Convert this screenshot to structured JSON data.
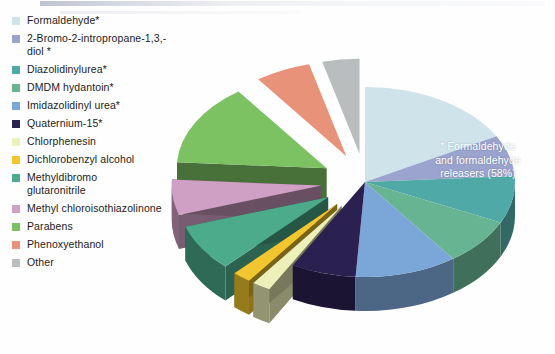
{
  "figure": {
    "background": "#ffffff"
  },
  "legend": {
    "items": [
      {
        "label": "Formaldehyde*",
        "color": "#cfe3ea"
      },
      {
        "label": "2-Bromo-2-intropropane-1,3,-\ndiol *",
        "color": "#9aa4ce"
      },
      {
        "label": "Diazolidinylurea*",
        "color": "#4fa9a6"
      },
      {
        "label": "DMDM hydantoin*",
        "color": "#67b493"
      },
      {
        "label": "Imidazolidinyl urea*",
        "color": "#7aa6d8"
      },
      {
        "label": "Quaternium-15*",
        "color": "#2b2150"
      },
      {
        "label": "Chlorphenesin",
        "color": "#edf0b8"
      },
      {
        "label": "Dichlorobenzyl alcohol",
        "color": "#f2c62e"
      },
      {
        "label": "Methyldibromo\nglutaronitrile",
        "color": "#4cab8a"
      },
      {
        "label": "Methyl chloroisothiazolinone",
        "color": "#cfa0c4"
      },
      {
        "label": "Parabens",
        "color": "#7cc162"
      },
      {
        "label": "Phenoxyethanol",
        "color": "#e8927a"
      },
      {
        "label": "Other",
        "color": "#b9bdbe"
      }
    ]
  },
  "callout": {
    "line1": "* Formaldehyde",
    "line2": "and formaldehyde",
    "line3": "releasers (58%)",
    "text_color": "#ffffff"
  },
  "chart_data": {
    "type": "pie",
    "annotations": [
      "* Formaldehyde and formaldehyde releasers (58%)"
    ],
    "legend_position": "left",
    "three_d": true,
    "grouped_total_label": "* Formaldehyde and formaldehyde releasers (58%)",
    "grouped_total_value": 58,
    "categories": [
      "Formaldehyde*",
      "2-Bromo-2-intropropane-1,3,-diol *",
      "Diazolidinylurea*",
      "DMDM hydantoin*",
      "Imidazolidinyl urea*",
      "Quaternium-15*",
      "Chlorphenesin",
      "Dichlorobenzyl alcohol",
      "Methyldibromo glutaronitrile",
      "Methyl chloroisothiazolinone",
      "Parabens",
      "Phenoxyethanol",
      "Other"
    ],
    "values": [
      17,
      7,
      8,
      8,
      11,
      7,
      2,
      2,
      8,
      6,
      14,
      6,
      4
    ],
    "colors": [
      "#cfe3ea",
      "#9aa4ce",
      "#4fa9a6",
      "#67b493",
      "#7aa6d8",
      "#2b2150",
      "#edf0b8",
      "#f2c62e",
      "#4cab8a",
      "#cfa0c4",
      "#7cc162",
      "#e8927a",
      "#b9bdbe"
    ],
    "exploded": [
      false,
      false,
      false,
      false,
      false,
      false,
      true,
      true,
      true,
      true,
      true,
      true,
      true
    ]
  }
}
